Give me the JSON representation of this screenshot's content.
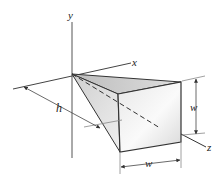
{
  "diagram": {
    "title": "",
    "axes": {
      "x": {
        "label": "x"
      },
      "y": {
        "label": "y"
      },
      "z": {
        "label": "z"
      }
    },
    "dimensions": {
      "h": {
        "label": "h"
      },
      "w_vertical": {
        "label": "w"
      },
      "w_horizontal": {
        "label": "w"
      }
    },
    "colors": {
      "line": "#333333",
      "thin_line": "#666666",
      "face_light": "#f2f2f2",
      "face_mid": "#d6d6d6",
      "face_dark": "#b9b9b9"
    }
  }
}
